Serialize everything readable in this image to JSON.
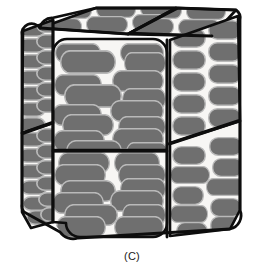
{
  "figure": {
    "caption": "(C)",
    "title": "",
    "type": "3d-block-diagram",
    "colors": {
      "background": "#ffffff",
      "outline": "#0d0d0d",
      "panel_fill": "#f7f6f4",
      "particle_fill": "#6f6f6f",
      "particle_outline": "#b9b9b9",
      "caption_text": "#1a1a1a"
    },
    "geometry": {
      "canvas_width": 264,
      "canvas_height": 274,
      "outline_width": 2.6,
      "divider_width": 2.6,
      "particle_outline_width": 1.4,
      "corner_radius": 14
    },
    "faces": [
      {
        "name": "left-face",
        "label": "left side face",
        "panels": 2,
        "particle_orientation": "edge-on-rows",
        "rows": 10,
        "per_row": 2
      },
      {
        "name": "front-face",
        "label": "front face",
        "panels": 2,
        "particle_orientation": "broadside-horizontal",
        "rows": 9,
        "per_row": 2
      },
      {
        "name": "right-face",
        "label": "right side face",
        "panels": 2,
        "particle_orientation": "broadside-horizontal",
        "rows": 9,
        "per_row": 2
      },
      {
        "name": "top-face",
        "label": "top face",
        "panels": 2,
        "particle_orientation": "broadside-oblique",
        "rows": 2,
        "per_row": 3
      }
    ]
  }
}
